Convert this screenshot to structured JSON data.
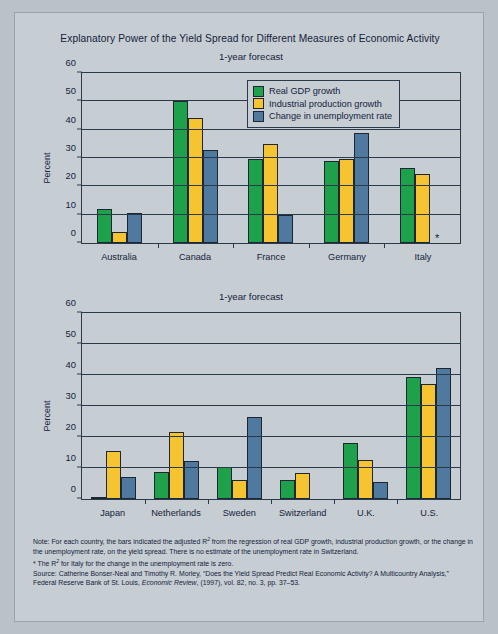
{
  "figure": {
    "title": "Explanatory Power of the Yield Spread for Different Measures of Economic Activity"
  },
  "legend": {
    "items": [
      {
        "label": "Real GDP growth",
        "color": "#1fa04a",
        "icon": "legend-swatch-green"
      },
      {
        "label": "Industrial production growth",
        "color": "#f6c430",
        "icon": "legend-swatch-yellow"
      },
      {
        "label": "Change in unemployment rate",
        "color": "#50799f",
        "icon": "legend-swatch-blue"
      }
    ]
  },
  "notes": {
    "note_line1": "Note: For each country, the bars indicated the adjusted R",
    "note_line1b": " from the regression of real GDP growth, industrial production growth, or the change in the unemployment rate, on the yield spread. There is no estimate of the unemployment rate in Switzerland.",
    "footnote_star_a": "* The R",
    "footnote_star_b": " for Italy for the change in the unemployment rate is zero.",
    "source_a": "Source: Catherine Bonser-Neal and Timothy R. Morley, “Does the Yield Spread Predict Real Economic Activity? A Multicountry Analysis,” Federal Reserve Bank of St. Louis, ",
    "source_italic": "Economic Review",
    "source_b": ", (1997), vol. 82, no. 3, pp. 37–53.",
    "superscript": "2"
  },
  "chart_data": [
    {
      "type": "bar",
      "id": "chart-1",
      "title": "1-year forecast",
      "xlabel": "",
      "ylabel": "Percent",
      "ylim": [
        0,
        60
      ],
      "yticks": [
        0,
        10,
        20,
        30,
        40,
        50,
        60
      ],
      "grid": true,
      "legend_position": "top-right",
      "categories": [
        "Australia",
        "Canada",
        "France",
        "Germany",
        "Italy"
      ],
      "series": [
        {
          "name": "Real GDP growth",
          "color": "#1fa04a",
          "values": [
            12.0,
            50.0,
            29.8,
            29.0,
            26.5
          ]
        },
        {
          "name": "Industrial production growth",
          "color": "#f6c430",
          "values": [
            4.0,
            44.0,
            34.8,
            29.5,
            24.5
          ]
        },
        {
          "name": "Change in unemployment rate",
          "color": "#50799f",
          "values": [
            10.5,
            33.0,
            9.8,
            39.0,
            0.0
          ]
        }
      ],
      "annotations": [
        {
          "category": "Italy",
          "series": "Change in unemployment rate",
          "marker": "*",
          "meaning": "zero"
        }
      ]
    },
    {
      "type": "bar",
      "id": "chart-2",
      "title": "1-year forecast",
      "xlabel": "",
      "ylabel": "Percent",
      "ylim": [
        0,
        60
      ],
      "yticks": [
        0,
        10,
        20,
        30,
        40,
        50,
        60
      ],
      "grid": true,
      "legend_position": "none",
      "categories": [
        "Japan",
        "Netherlands",
        "Sweden",
        "Switzerland",
        "U.K.",
        "U.S."
      ],
      "series": [
        {
          "name": "Real GDP growth",
          "color": "#1fa04a",
          "values": [
            0.5,
            8.8,
            10.2,
            6.2,
            18.2,
            39.5
          ]
        },
        {
          "name": "Industrial production growth",
          "color": "#f6c430",
          "values": [
            15.6,
            21.7,
            6.0,
            8.5,
            12.7,
            37.2
          ]
        },
        {
          "name": "Change in unemployment rate",
          "color": "#50799f",
          "values": [
            7.0,
            12.3,
            26.6,
            0.0,
            5.6,
            42.2
          ]
        }
      ],
      "annotations": [
        {
          "category": "Switzerland",
          "series": "Change in unemployment rate",
          "marker": "",
          "meaning": "no estimate"
        }
      ]
    }
  ]
}
